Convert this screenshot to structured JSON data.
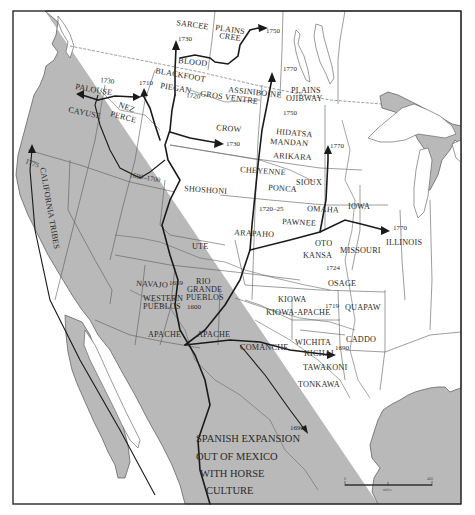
{
  "map": {
    "subject": "Spread of the horse among North American Indian tribes",
    "main_caption_lines": [
      "SPANISH EXPANSION",
      "OUT OF MEXICO",
      "WITH HORSE",
      "CULTURE"
    ],
    "tribes": {
      "sarcee": "SARCEE",
      "plains_cree_1": "PLAINS",
      "plains_cree_2": "CREE",
      "blood": "BLOOD",
      "blackfoot": "BLACKFOOT",
      "piegan": "PIEGAN",
      "gros_ventre": "GROS VENTRE",
      "assiniboine": "ASSINIBOINE",
      "plains_ojibway_1": "PLAINS",
      "plains_ojibway_2": "OJIBWAY",
      "palouse": "PALOUSE",
      "nez_perce_1": "NEZ",
      "nez_perce_2": "PERCE",
      "cayuse": "CAYUSE",
      "crow": "CROW",
      "hidatsa": "HIDATSA",
      "mandan": "MANDAN",
      "arikara": "ARIKARA",
      "shoshoni": "SHOSHONI",
      "cheyenne": "CHEYENNE",
      "sioux": "SIOUX",
      "ponca": "PONCA",
      "omaha": "OMAHA",
      "iowa": "IOWA",
      "pawnee": "PAWNEE",
      "arapaho": "ARAPAHO",
      "ute": "UTE",
      "oto": "OTO",
      "missouri": "MISSOURI",
      "illinois": "ILLINOIS",
      "kansa": "KANSA",
      "osage": "OSAGE",
      "quapaw": "QUAPAW",
      "navajo": "NAVAJO",
      "rio_grande_pueblos_1": "RIO",
      "rio_grande_pueblos_2": "GRANDE",
      "rio_grande_pueblos_3": "PUEBLOS",
      "western_pueblos_1": "WESTERN",
      "western_pueblos_2": "PUEBLOS",
      "kiowa": "KIOWA",
      "kiowa_apache": "KIOWA-APACHE",
      "caddo": "CADDO",
      "wichita": "WICHITA",
      "kichai": "KICHAI",
      "tawakoni": "TAWAKONI",
      "tonkawa": "TONKAWA",
      "comanche": "COMANCHE",
      "apache_west": "APACHE",
      "apache_east": "APACHE",
      "california_tribes": "CALIFORNIA TRIBES"
    },
    "dates": {
      "blackfoot_1730": "1730",
      "plains_cree_1750": "1750",
      "plains_ojibway_1770": "1770",
      "mandan_1750": "1750",
      "palouse_1730": "1730",
      "piegan_1710": "1710",
      "gros_ventre_1720": "1720",
      "crow_1730": "1730",
      "great_basin_1690_1700": "1690–1700",
      "sioux_1770": "1770",
      "pawnee_1720_25": "1720–25",
      "illinois_1770": "1770",
      "osage_1724": "1724",
      "quapaw_1719": "1719",
      "caddo_1690": "1690",
      "navajo_1659": "1659",
      "pueblos_1600": "1600",
      "texas_1690": "1690",
      "california_1775": "1775"
    },
    "scale_bar": {
      "start_label": "0",
      "end_label": "400",
      "unit_label": "miles"
    }
  }
}
